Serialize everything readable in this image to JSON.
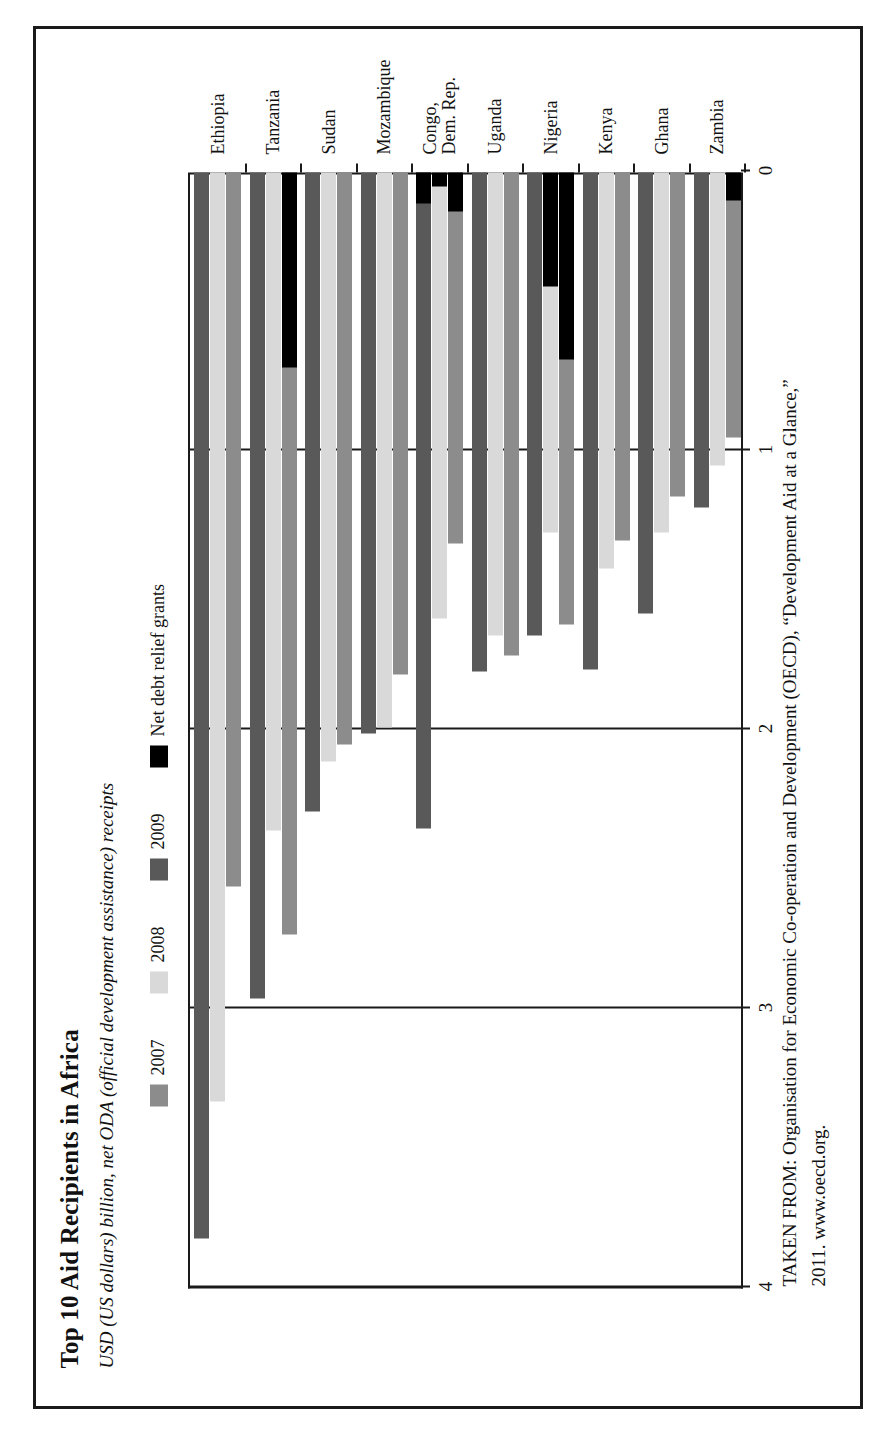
{
  "figure": {
    "title": "Top 10 Aid Recipients in Africa",
    "subtitle": "USD (US dollars) billion, net ODA (official development assistance) receipts",
    "source_line1": "TAKEN FROM: Organisation for Economic Co-operation and Development (OECD), “Development Aid at a Glance,”",
    "source_line2": "2011. www.oecd.org."
  },
  "colors": {
    "series_2007": "#8c8c8c",
    "series_2008": "#d9d9d9",
    "series_2009": "#595959",
    "debt_relief": "#000000",
    "axis": "#1a1a1a",
    "background": "#ffffff"
  },
  "legend": {
    "items": [
      {
        "label": "2007",
        "color_key": "series_2007",
        "icon": "legend-swatch-icon"
      },
      {
        "label": "2008",
        "color_key": "series_2008",
        "icon": "legend-swatch-icon"
      },
      {
        "label": "2009",
        "color_key": "series_2009",
        "icon": "legend-swatch-icon"
      },
      {
        "label": "Net debt relief grants",
        "color_key": "debt_relief",
        "icon": "legend-swatch-icon"
      }
    ]
  },
  "chart_data": {
    "type": "bar",
    "orientation": "horizontal",
    "title": "Top 10 Aid Recipients in Africa",
    "subtitle": "USD (US dollars) billion, net ODA (official development assistance) receipts",
    "xlabel": "",
    "ylabel": "",
    "xlim": [
      0,
      4
    ],
    "xticks": [
      0,
      1,
      2,
      3,
      4
    ],
    "xtick_labels": [
      "0",
      "1",
      "2",
      "3",
      "4"
    ],
    "grid": true,
    "legend_position": "top",
    "categories": [
      "Ethiopia",
      "Tanzania",
      "Sudan",
      "Mozambique",
      "Congo, Dem. Rep.",
      "Uganda",
      "Nigeria",
      "Kenya",
      "Ghana",
      "Zambia"
    ],
    "category_labels": [
      [
        "Ethiopia"
      ],
      [
        "Tanzania"
      ],
      [
        "Sudan"
      ],
      [
        "Mozambique"
      ],
      [
        "Congo,",
        "Dem. Rep."
      ],
      [
        "Uganda"
      ],
      [
        "Nigeria"
      ],
      [
        "Kenya"
      ],
      [
        "Ghana"
      ],
      [
        "Zambia"
      ]
    ],
    "series": [
      {
        "name": "2007",
        "color_key": "series_2007",
        "values": [
          2.56,
          2.73,
          2.05,
          1.8,
          1.33,
          1.73,
          1.62,
          1.32,
          1.16,
          0.95
        ]
      },
      {
        "name": "2008",
        "color_key": "series_2008",
        "values": [
          3.33,
          2.36,
          2.11,
          1.99,
          1.6,
          1.66,
          1.29,
          1.42,
          1.29,
          1.05
        ]
      },
      {
        "name": "2009",
        "color_key": "series_2009",
        "values": [
          3.82,
          2.96,
          2.29,
          2.01,
          2.35,
          1.79,
          1.66,
          1.78,
          1.58,
          1.2
        ]
      }
    ],
    "debt_relief": {
      "name": "Net debt relief grants",
      "color_key": "debt_relief",
      "note": "black segment drawn at the zero end of the bar",
      "values_2007": [
        0.0,
        0.7,
        0.0,
        0.0,
        0.14,
        0.0,
        0.67,
        0.0,
        0.0,
        0.1
      ],
      "values_2008": [
        0.0,
        0.0,
        0.0,
        0.0,
        0.05,
        0.0,
        0.41,
        0.0,
        0.0,
        0.0
      ],
      "values_2009": [
        0.0,
        0.0,
        0.0,
        0.0,
        0.11,
        0.0,
        0.0,
        0.0,
        0.0,
        0.0
      ]
    }
  }
}
